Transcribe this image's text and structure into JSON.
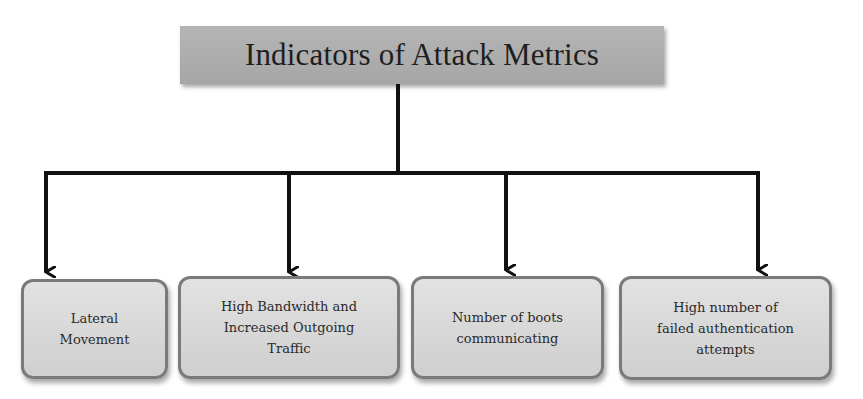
{
  "diagram": {
    "title": "Indicators of Attack Metrics",
    "children": [
      {
        "label": "Lateral\nMovement"
      },
      {
        "label": "High Bandwidth and\nIncreased Outgoing\nTraffic"
      },
      {
        "label": "Number of boots\ncommunicating"
      },
      {
        "label": "High number of\nfailed authentication\nattempts"
      }
    ],
    "colors": {
      "title_fill": "#adadad",
      "leaf_fill": "#d9d9d9",
      "leaf_border": "#7a7a7a",
      "connector": "#111111"
    }
  }
}
